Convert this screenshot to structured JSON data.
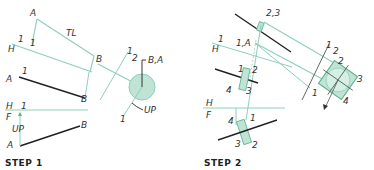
{
  "colors": {
    "ink": "#222222",
    "green_line": "#8fcfb8",
    "green_fill": "#bfe4d6",
    "green_stroke": "#5fae92"
  },
  "step1": {
    "title": "STEP 1",
    "labels": {
      "a_top": "A",
      "tl": "TL",
      "one_top": "1",
      "one_small": "1",
      "h_top": "H",
      "b_top": "B",
      "a_mid": "A",
      "one_mid": "1",
      "b_mid": "B",
      "one_two": "1",
      "two": "2",
      "ba": "B,A",
      "h_low": "H",
      "one_low": "1",
      "f_low": "F",
      "up_left": "UP",
      "a_low": "A",
      "b_low": "B",
      "up_right": "UP",
      "one_right": "1"
    }
  },
  "step2": {
    "title": "STEP 2",
    "labels": {
      "two_three": "2,3",
      "one_top": "1",
      "h_top": "H",
      "one_a": "1,A",
      "one_2": "1",
      "two_2": "2",
      "four_2": "4",
      "three_2": "3",
      "sec_one": "1",
      "sec_two": "2",
      "sq_two": "2",
      "sq_three": "3",
      "sq_four": "4",
      "sq_one": "1",
      "h_low": "H",
      "f_low": "F",
      "four_low": "4",
      "one_low": "1",
      "three_low": "3",
      "two_low": "2"
    }
  }
}
